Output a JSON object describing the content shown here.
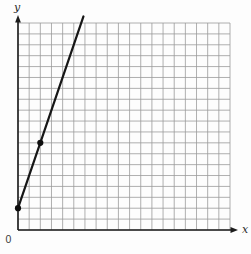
{
  "figure": {
    "background": "#fdfdfd",
    "grid_color": "#9b9b9b",
    "axis_color": "#1c1c1c",
    "line_color": "#161616",
    "point_color": "#0e0e0e"
  },
  "labels": {
    "y_axis": "y",
    "x_axis": "x",
    "origin": "0"
  },
  "chart_data": {
    "type": "line",
    "title": "",
    "xlabel": "x",
    "ylabel": "y",
    "x_range": [
      0,
      19
    ],
    "y_range": [
      0,
      19
    ],
    "grid_step": 1,
    "grid": true,
    "legend": false,
    "points": [
      [
        0,
        2
      ],
      [
        2,
        8
      ]
    ],
    "line": {
      "slope": 3,
      "intercept": 2,
      "x_start": 0,
      "draw_to_y": 19.6
    }
  }
}
